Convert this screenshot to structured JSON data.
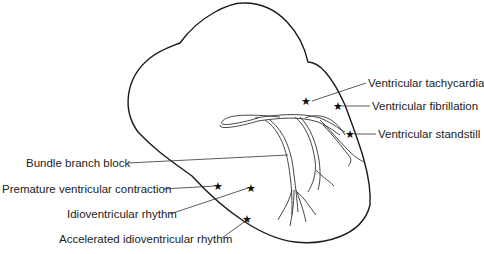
{
  "diagram": {
    "title": "",
    "colors": {
      "outline": "#1a1a1a",
      "text": "#222222",
      "background": "#ffffff"
    },
    "labels": [
      {
        "id": "vt",
        "text": "Ventricular tachycardia",
        "side": "right"
      },
      {
        "id": "vf",
        "text": "Ventricular fibrillation",
        "side": "right"
      },
      {
        "id": "vs",
        "text": "Ventricular standstill",
        "side": "right"
      },
      {
        "id": "bbb",
        "text": "Bundle branch block",
        "side": "left"
      },
      {
        "id": "pvc",
        "text": "Premature ventricular contraction",
        "side": "left"
      },
      {
        "id": "ivr",
        "text": "Idioventricular rhythm",
        "side": "left"
      },
      {
        "id": "aivr",
        "text": "Accelerated idioventricular rhythm",
        "side": "left"
      }
    ],
    "marker_glyph": "★"
  }
}
